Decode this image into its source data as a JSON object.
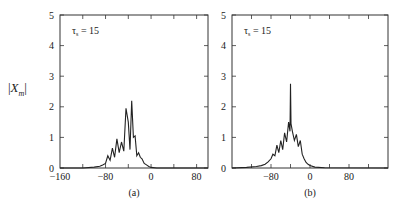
{
  "figure": {
    "ylabel_prefix": "|",
    "ylabel_var": "X",
    "ylabel_sub": "m",
    "ylabel_suffix": "|",
    "panels": [
      {
        "caption": "(a)",
        "annotation": "τs = 15"
      },
      {
        "caption": "(b)",
        "annotation": "τs = 15"
      }
    ]
  },
  "chart_data": [
    {
      "type": "line",
      "title": "",
      "panel_label": "(a)",
      "annotation": "τs = 15",
      "xlabel": "",
      "ylabel": "|Xm|",
      "xlim": [
        -160,
        100
      ],
      "ylim": [
        0,
        5
      ],
      "xticks": [
        -160,
        -80,
        0,
        80
      ],
      "yticks": [
        0,
        1,
        2,
        3,
        4,
        5
      ],
      "grid": false,
      "x": [
        -160,
        -120,
        -100,
        -90,
        -85,
        -80,
        -76,
        -72,
        -68,
        -64,
        -60,
        -56,
        -52,
        -48,
        -44,
        -40,
        -37,
        -34,
        -31,
        -28,
        -25,
        -22,
        -19,
        -16,
        -12,
        -8,
        -4,
        0,
        10,
        40,
        100
      ],
      "series": [
        {
          "name": "|Xm|",
          "values": [
            0,
            0,
            0.03,
            0.06,
            0.1,
            0.15,
            0.4,
            0.25,
            0.65,
            0.35,
            0.95,
            0.5,
            0.85,
            0.55,
            1.95,
            1.5,
            0.6,
            2.2,
            1.0,
            1.05,
            0.4,
            0.5,
            0.35,
            0.3,
            0.15,
            0.1,
            0.05,
            0.02,
            0,
            0,
            0
          ]
        }
      ]
    },
    {
      "type": "line",
      "title": "",
      "panel_label": "(b)",
      "annotation": "τs = 15",
      "xlabel": "",
      "ylabel": "|Xm|",
      "xlim": [
        -160,
        160
      ],
      "ylim": [
        0,
        5
      ],
      "xticks": [
        -80,
        0,
        80
      ],
      "yticks": [
        0,
        1,
        2,
        3,
        4,
        5
      ],
      "grid": false,
      "x": [
        -160,
        -130,
        -110,
        -100,
        -92,
        -86,
        -80,
        -76,
        -72,
        -68,
        -64,
        -60,
        -56,
        -52,
        -48,
        -44,
        -41,
        -40,
        -39,
        -36,
        -32,
        -28,
        -24,
        -20,
        -16,
        -12,
        -8,
        -4,
        0,
        10,
        30,
        160
      ],
      "series": [
        {
          "name": "|Xm|",
          "values": [
            0,
            0.02,
            0.05,
            0.08,
            0.12,
            0.2,
            0.3,
            0.45,
            0.4,
            0.75,
            0.5,
            0.9,
            0.6,
            1.15,
            0.85,
            1.5,
            1.2,
            2.75,
            1.45,
            1.2,
            0.9,
            1.1,
            0.7,
            0.9,
            0.45,
            0.3,
            0.18,
            0.12,
            0.08,
            0.03,
            0.01,
            0
          ]
        }
      ]
    }
  ]
}
